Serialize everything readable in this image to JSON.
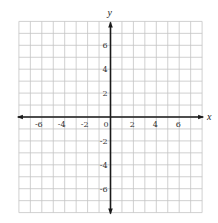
{
  "chart_data": {
    "type": "scatter",
    "title": "",
    "xlabel": "x",
    "ylabel": "y",
    "xlim": [
      -8,
      8
    ],
    "ylim": [
      -8,
      8
    ],
    "grid": true,
    "grid_step": 1,
    "x_ticks": [
      -6,
      -4,
      -2,
      0,
      2,
      4,
      6
    ],
    "y_ticks": [
      -6,
      -4,
      -2,
      2,
      4,
      6
    ],
    "x_tick_labels": [
      "-6",
      "-4",
      "-2",
      "0",
      "2",
      "4",
      "6"
    ],
    "y_tick_labels": [
      "-6",
      "-4",
      "-2",
      "2",
      "4",
      "6"
    ],
    "series": [],
    "legend": null,
    "axes_arrows": true
  },
  "layout": {
    "origin_px": [
      110.5,
      117
    ],
    "unit_px_x": 11.45,
    "unit_px_y": 11.95,
    "grid_color": "#c4c4c4",
    "axis_color": "#1a1a1a"
  }
}
